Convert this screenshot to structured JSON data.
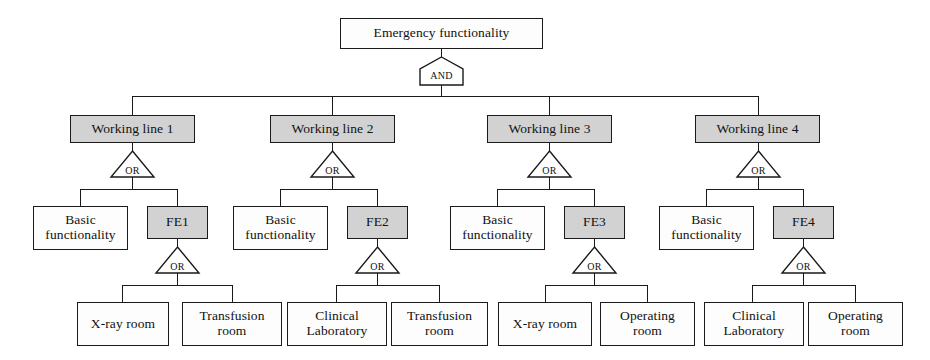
{
  "diagram": {
    "type": "fault-tree",
    "title_node": "Emergency functionality",
    "colors": {
      "gray_fill": "#d2d2d2",
      "white_fill": "#fdfdfd",
      "stroke": "#1a1a1a"
    },
    "gates": {
      "and": "AND",
      "or": "OR"
    },
    "root": {
      "label": "Emergency functionality",
      "gate": "AND",
      "fill": "gray-outline"
    },
    "branches": [
      {
        "line_label": "Working line 1",
        "gate": "OR",
        "basic_label": "Basic\nfunctionality",
        "fe_label": "FE1",
        "fe_gate": "OR",
        "leaves": [
          "X-ray room",
          "Transfusion\nroom"
        ]
      },
      {
        "line_label": "Working line 2",
        "gate": "OR",
        "basic_label": "Basic\nfunctionality",
        "fe_label": "FE2",
        "fe_gate": "OR",
        "leaves": [
          "Clinical\nLaboratory",
          "Transfusion\nroom"
        ]
      },
      {
        "line_label": "Working line 3",
        "gate": "OR",
        "basic_label": "Basic\nfunctionality",
        "fe_label": "FE3",
        "fe_gate": "OR",
        "leaves": [
          "X-ray room",
          "Operating\nroom"
        ]
      },
      {
        "line_label": "Working line 4",
        "gate": "OR",
        "basic_label": "Basic\nfunctionality",
        "fe_label": "FE4",
        "fe_gate": "OR",
        "leaves": [
          "Clinical\nLaboratory",
          "Operating\nroom"
        ]
      }
    ]
  }
}
